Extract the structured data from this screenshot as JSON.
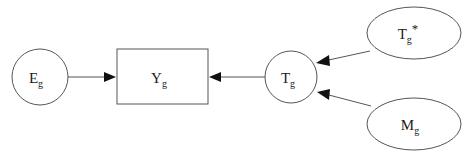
{
  "diagram": {
    "type": "path-diagram",
    "background_color": "#ffffff",
    "stroke_color": "#555555",
    "arrow_color": "#111111",
    "nodes": [
      {
        "id": "Eg",
        "shape": "circle",
        "base": "E",
        "subscript": "g",
        "superscript": "",
        "cx": 40,
        "cy": 77,
        "rx": 28,
        "ry": 28
      },
      {
        "id": "Yg",
        "shape": "rectangle",
        "base": "Y",
        "subscript": "g",
        "superscript": "",
        "x": 117,
        "y": 49,
        "width": 91,
        "height": 55
      },
      {
        "id": "Tg",
        "shape": "circle",
        "base": "T",
        "subscript": "g",
        "superscript": "",
        "cx": 291,
        "cy": 77,
        "rx": 26,
        "ry": 26
      },
      {
        "id": "Tgstar",
        "shape": "ellipse",
        "base": "T",
        "subscript": "g",
        "superscript": "*",
        "cx": 414,
        "cy": 33,
        "rx": 47,
        "ry": 26
      },
      {
        "id": "Mg",
        "shape": "ellipse",
        "base": "M",
        "subscript": "g",
        "superscript": "",
        "cx": 414,
        "cy": 124,
        "rx": 47,
        "ry": 26
      }
    ],
    "edges": [
      {
        "id": "Eg-to-Yg",
        "from": "Eg",
        "to": "Yg",
        "direction": "right",
        "x1": 68,
        "y1": 77,
        "x2": 116,
        "y2": 77
      },
      {
        "id": "Tg-to-Yg",
        "from": "Tg",
        "to": "Yg",
        "direction": "left",
        "x1": 265,
        "y1": 77,
        "x2": 209,
        "y2": 77
      },
      {
        "id": "Tgstar-to-Tg",
        "from": "Tgstar",
        "to": "Tg",
        "direction": "down-left",
        "x1": 370,
        "y1": 51,
        "x2": 316,
        "y2": 63
      },
      {
        "id": "Mg-to-Tg",
        "from": "Mg",
        "to": "Tg",
        "direction": "up-left",
        "x1": 371,
        "y1": 106,
        "x2": 317,
        "y2": 92
      }
    ]
  }
}
